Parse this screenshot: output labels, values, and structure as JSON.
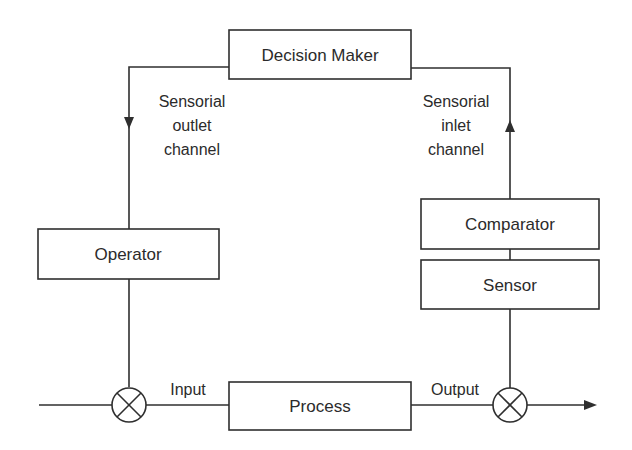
{
  "diagram": {
    "type": "block-diagram",
    "title": "",
    "colors": {
      "line": "#2f2f2f",
      "text": "#2b2b2b",
      "background": "#ffffff"
    },
    "blocks": {
      "decision_maker": {
        "label": "Decision Maker"
      },
      "operator": {
        "label": "Operator"
      },
      "comparator": {
        "label": "Comparator"
      },
      "sensor": {
        "label": "Sensor"
      },
      "process": {
        "label": "Process"
      }
    },
    "labels": {
      "outlet": {
        "line1": "Sensorial",
        "line2": "outlet",
        "line3": "channel"
      },
      "inlet": {
        "line1": "Sensorial",
        "line2": "inlet",
        "line3": "channel"
      },
      "input": "Input",
      "output": "Output"
    },
    "junctions": [
      {
        "id": "summing-junction-input",
        "symbol": "circle-x"
      },
      {
        "id": "summing-junction-output",
        "symbol": "circle-x"
      }
    ],
    "connections": [
      {
        "from": "external-input",
        "to": "summing-junction-input"
      },
      {
        "from": "decision_maker",
        "to": "operator",
        "label": "Sensorial outlet channel",
        "arrow": "down"
      },
      {
        "from": "operator",
        "to": "summing-junction-input"
      },
      {
        "from": "summing-junction-input",
        "to": "process",
        "label": "Input"
      },
      {
        "from": "process",
        "to": "summing-junction-output",
        "label": "Output"
      },
      {
        "from": "summing-junction-output",
        "to": "external-output",
        "arrow": "right"
      },
      {
        "from": "summing-junction-output",
        "to": "sensor"
      },
      {
        "from": "sensor",
        "to": "comparator"
      },
      {
        "from": "comparator",
        "to": "decision_maker",
        "label": "Sensorial inlet channel",
        "arrow": "up"
      }
    ]
  }
}
